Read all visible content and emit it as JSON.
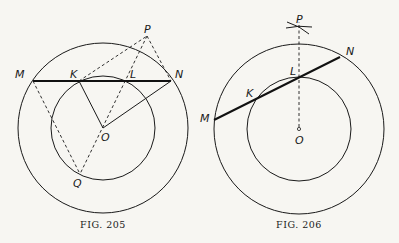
{
  "figures": [
    {
      "caption": "Fig. 205",
      "caption_display": "FIG. 205",
      "center": {
        "x": 103,
        "y": 128
      },
      "outer_radius": 85,
      "inner_radius": 52,
      "points": {
        "M": {
          "label": "M",
          "x": 33,
          "y": 81
        },
        "K": {
          "label": "K",
          "x": 79,
          "y": 81
        },
        "L": {
          "label": "L",
          "x": 125,
          "y": 81
        },
        "N": {
          "label": "N",
          "x": 171,
          "y": 81
        },
        "P": {
          "label": "P",
          "x": 147,
          "y": 36
        },
        "O": {
          "label": "O",
          "x": 103,
          "y": 128
        },
        "Q": {
          "label": "Q",
          "x": 80,
          "y": 174
        }
      }
    },
    {
      "caption": "Fig. 206",
      "caption_display": "FIG. 206",
      "center": {
        "x": 299,
        "y": 129
      },
      "outer_radius": 85,
      "inner_radius": 52,
      "points": {
        "M": {
          "label": "M",
          "x": 214,
          "y": 120
        },
        "K": {
          "label": "K",
          "x": 257,
          "y": 99
        },
        "L": {
          "label": "L",
          "x": 299,
          "y": 78
        },
        "N": {
          "label": "N",
          "x": 340,
          "y": 57
        },
        "P": {
          "label": "P",
          "x": 299,
          "y": 26
        },
        "O": {
          "label": "O",
          "x": 299,
          "y": 129
        }
      }
    }
  ]
}
